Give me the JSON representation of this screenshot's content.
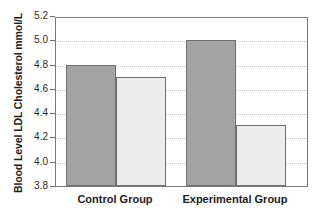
{
  "chart_data": {
    "type": "bar",
    "title": "",
    "xlabel": "",
    "ylabel": "Blood Level LDL Cholesterol mmol/L",
    "ylim": [
      3.8,
      5.2
    ],
    "ytick_step": 0.2,
    "yticks": [
      "5.2",
      "5.0",
      "4.8",
      "4.6",
      "4.4",
      "4.2",
      "4.0",
      "3.8"
    ],
    "ytick_values": [
      5.2,
      5.0,
      4.8,
      4.6,
      4.4,
      4.2,
      4.0,
      3.8
    ],
    "grid": true,
    "legend": "none",
    "categories": [
      "Control Group",
      "Experimental Group"
    ],
    "series": [
      {
        "name": "Before",
        "color": "#a3a3a3",
        "values": [
          4.8,
          5.0
        ]
      },
      {
        "name": "After",
        "color": "#ececec",
        "values": [
          4.7,
          4.3
        ]
      }
    ],
    "bars": [
      {
        "group": "Control Group",
        "series": "Before",
        "value": 4.8,
        "color": "#a3a3a3"
      },
      {
        "group": "Control Group",
        "series": "After",
        "value": 4.7,
        "color": "#ececec"
      },
      {
        "group": "Experimental Group",
        "series": "Before",
        "value": 5.0,
        "color": "#a3a3a3"
      },
      {
        "group": "Experimental Group",
        "series": "After",
        "value": 4.3,
        "color": "#ececec"
      }
    ]
  },
  "axis": {
    "y_title": "Blood Level LDL Cholesterol mmol/L",
    "ticks": [
      {
        "label": "5.2"
      },
      {
        "label": "5.0"
      },
      {
        "label": "4.8"
      },
      {
        "label": "4.6"
      },
      {
        "label": "4.4"
      },
      {
        "label": "4.2"
      },
      {
        "label": "4.0"
      },
      {
        "label": "3.8"
      }
    ]
  },
  "categories": [
    {
      "label": "Control Group"
    },
    {
      "label": "Experimental Group"
    }
  ],
  "colors": {
    "bar_dark": "#a3a3a3",
    "bar_light": "#ececec",
    "bar_border": "#6f6f6f",
    "axis": "#7a7a7a",
    "gridline": "#c9c9c9",
    "text": "#1c1c1c",
    "background": "#ffffff"
  }
}
